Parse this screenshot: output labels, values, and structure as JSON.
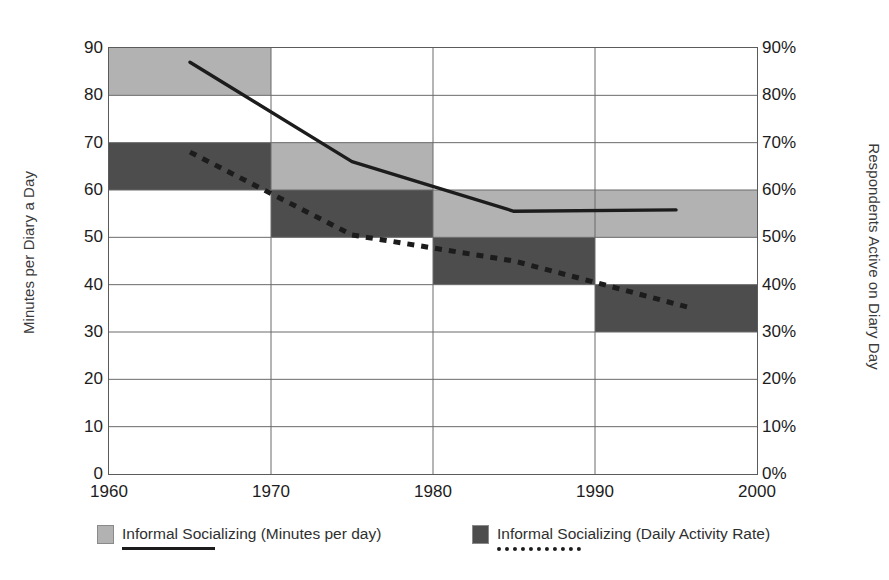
{
  "chart_data": {
    "type": "bar",
    "title": "",
    "subtitle": "",
    "xlabel": "",
    "ylabel": "Minutes per Diary a Day",
    "ylabel_right": "Respondents Active on Diary Day",
    "xlim": [
      1960,
      2000
    ],
    "ylim": [
      0,
      90
    ],
    "ylim_right": [
      0,
      90
    ],
    "grid": true,
    "legend_position": "bottom",
    "x_ticks": [
      "1960",
      "1970",
      "1980",
      "1990",
      "2000"
    ],
    "x_tick_values": [
      1960,
      1970,
      1980,
      1990,
      2000
    ],
    "y_ticks_left": [
      "0",
      "10",
      "20",
      "30",
      "40",
      "50",
      "60",
      "70",
      "80",
      "90"
    ],
    "y_tick_values_left": [
      0,
      10,
      20,
      30,
      40,
      50,
      60,
      70,
      80,
      90
    ],
    "y_ticks_right": [
      "0%",
      "10%",
      "20%",
      "30%",
      "40%",
      "50%",
      "60%",
      "70%",
      "80%",
      "90%"
    ],
    "y_tick_values_right": [
      0,
      10,
      20,
      30,
      40,
      50,
      60,
      70,
      80,
      90
    ],
    "decade_spans": [
      [
        1960,
        1970
      ],
      [
        1970,
        1980
      ],
      [
        1980,
        1990
      ],
      [
        1990,
        2000
      ]
    ],
    "series": [
      {
        "name": "Informal Socializing (Minutes per day)",
        "kind": "band",
        "color": "#b2b2b2",
        "axis": "left",
        "bands": [
          {
            "span": [
              1960,
              1970
            ],
            "low": 80,
            "high": 90
          },
          {
            "span": [
              1970,
              1980
            ],
            "low": 60,
            "high": 70
          },
          {
            "span": [
              1980,
              1990
            ],
            "low": 50,
            "high": 60
          },
          {
            "span": [
              1990,
              2000
            ],
            "low": 50,
            "high": 60
          }
        ]
      },
      {
        "name": "Informal Socializing (Daily Activity Rate)",
        "kind": "band",
        "color": "#4d4d4d",
        "axis": "right",
        "bands": [
          {
            "span": [
              1960,
              1970
            ],
            "low": 60,
            "high": 70
          },
          {
            "span": [
              1970,
              1980
            ],
            "low": 50,
            "high": 60
          },
          {
            "span": [
              1980,
              1990
            ],
            "low": 40,
            "high": 50
          },
          {
            "span": [
              1990,
              2000
            ],
            "low": 30,
            "high": 40
          }
        ]
      },
      {
        "name": "Informal Socializing (Minutes per day) trend",
        "kind": "line",
        "style": "solid",
        "color": "#1c1c1c",
        "axis": "left",
        "points": [
          {
            "x": 1965,
            "y": 87
          },
          {
            "x": 1975,
            "y": 66
          },
          {
            "x": 1985,
            "y": 55.5
          },
          {
            "x": 1995,
            "y": 55.8
          }
        ]
      },
      {
        "name": "Informal Socializing (Daily Activity Rate) trend",
        "kind": "line",
        "style": "dashed",
        "color": "#1c1c1c",
        "axis": "right",
        "points": [
          {
            "x": 1965,
            "y": 68
          },
          {
            "x": 1975,
            "y": 50.5
          },
          {
            "x": 1985,
            "y": 45
          },
          {
            "x": 1990,
            "y": 40.5
          },
          {
            "x": 1996,
            "y": 35
          }
        ]
      }
    ]
  },
  "legend": {
    "entries": [
      {
        "label": "Informal Socializing (Minutes per day)",
        "swatch_color": "#b2b2b2",
        "line_style": "solid"
      },
      {
        "label": "Informal Socializing (Daily Activity Rate)",
        "swatch_color": "#4d4d4d",
        "line_style": "dashed"
      }
    ]
  },
  "colors": {
    "light_band": "#b2b2b2",
    "dark_band": "#4d4d4d",
    "grid": "#6a6a6a",
    "axis": "#4a4a4a",
    "line": "#1c1c1c",
    "text": "#1c1c1c",
    "background": "#ffffff"
  }
}
